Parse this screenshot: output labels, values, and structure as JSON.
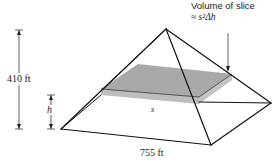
{
  "figure": {
    "type": "pyramid-volume-slice",
    "labels": {
      "height": "410 ft",
      "base": "755 ft",
      "slice_height_var": "h",
      "slice_side_var": "s",
      "callout_title": "Volume of slice",
      "callout_formula": "≈ s²Δh"
    },
    "colors": {
      "edge": "#111111",
      "slice_top": "#a9a9a9",
      "slice_side": "#bdbdbd",
      "text": "#222222",
      "background": "#ffffff"
    }
  }
}
